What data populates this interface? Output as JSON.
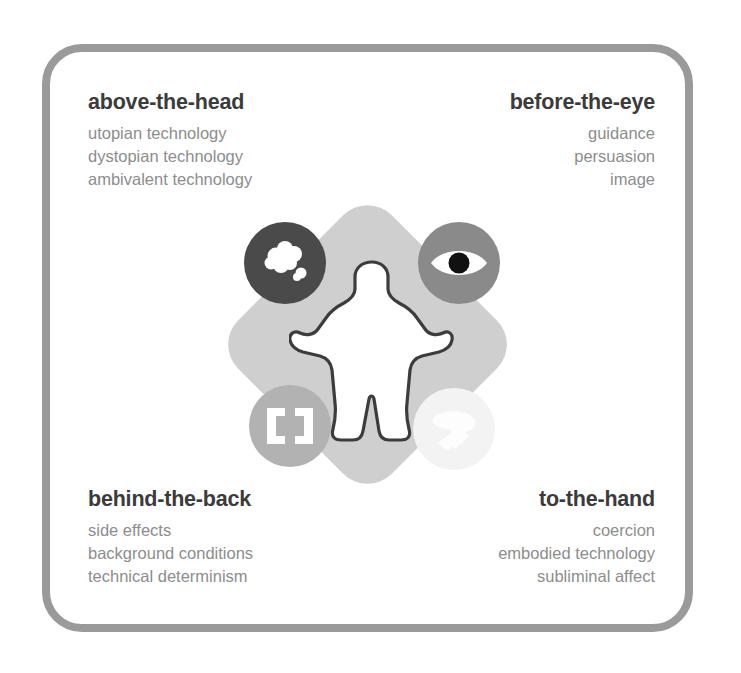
{
  "diagram": {
    "frame": {
      "border_color": "#9a9a9a",
      "background_color": "#ffffff"
    },
    "quadrants": [
      {
        "key": "above-the-head",
        "title": "above-the-head",
        "align": "left",
        "items": [
          "utopian technology",
          "dystopian technology",
          "ambivalent technology"
        ]
      },
      {
        "key": "before-the-eye",
        "title": "before-the-eye",
        "align": "right",
        "items": [
          "guidance",
          "persuasion",
          "image"
        ]
      },
      {
        "key": "behind-the-back",
        "title": "behind-the-back",
        "align": "left",
        "items": [
          "side effects",
          "background conditions",
          "technical determinism"
        ]
      },
      {
        "key": "to-the-hand",
        "title": "to-the-hand",
        "align": "right",
        "items": [
          "coercion",
          "embodied technology",
          "subliminal affect"
        ]
      }
    ],
    "center": {
      "diamond_color": "#cfcfcf",
      "figure_name": "human-figure",
      "figure_fill": "#ffffff",
      "figure_outline": "#3c3c3c",
      "icons": [
        {
          "key": "cloud-icon",
          "name": "cloud-icon",
          "position": "top-left",
          "circle_color": "#4a4a4a",
          "glyph_color": "#ffffff"
        },
        {
          "key": "eye-icon",
          "name": "eye-icon",
          "position": "top-right",
          "circle_color": "#8a8a8a",
          "glyph_color": "#ffffff",
          "pupil_color": "#111111"
        },
        {
          "key": "brackets-icon",
          "name": "brackets-icon",
          "position": "bottom-left",
          "circle_color": "#b2b2b2",
          "glyph_color": "#ffffff"
        },
        {
          "key": "hand-icon",
          "name": "hand-icon",
          "position": "bottom-right",
          "circle_color": "#f3f3f3",
          "glyph_color": "#fdfdfd"
        }
      ]
    },
    "text_colors": {
      "title": "#3b3b3b",
      "item": "#8d8d8d"
    }
  }
}
